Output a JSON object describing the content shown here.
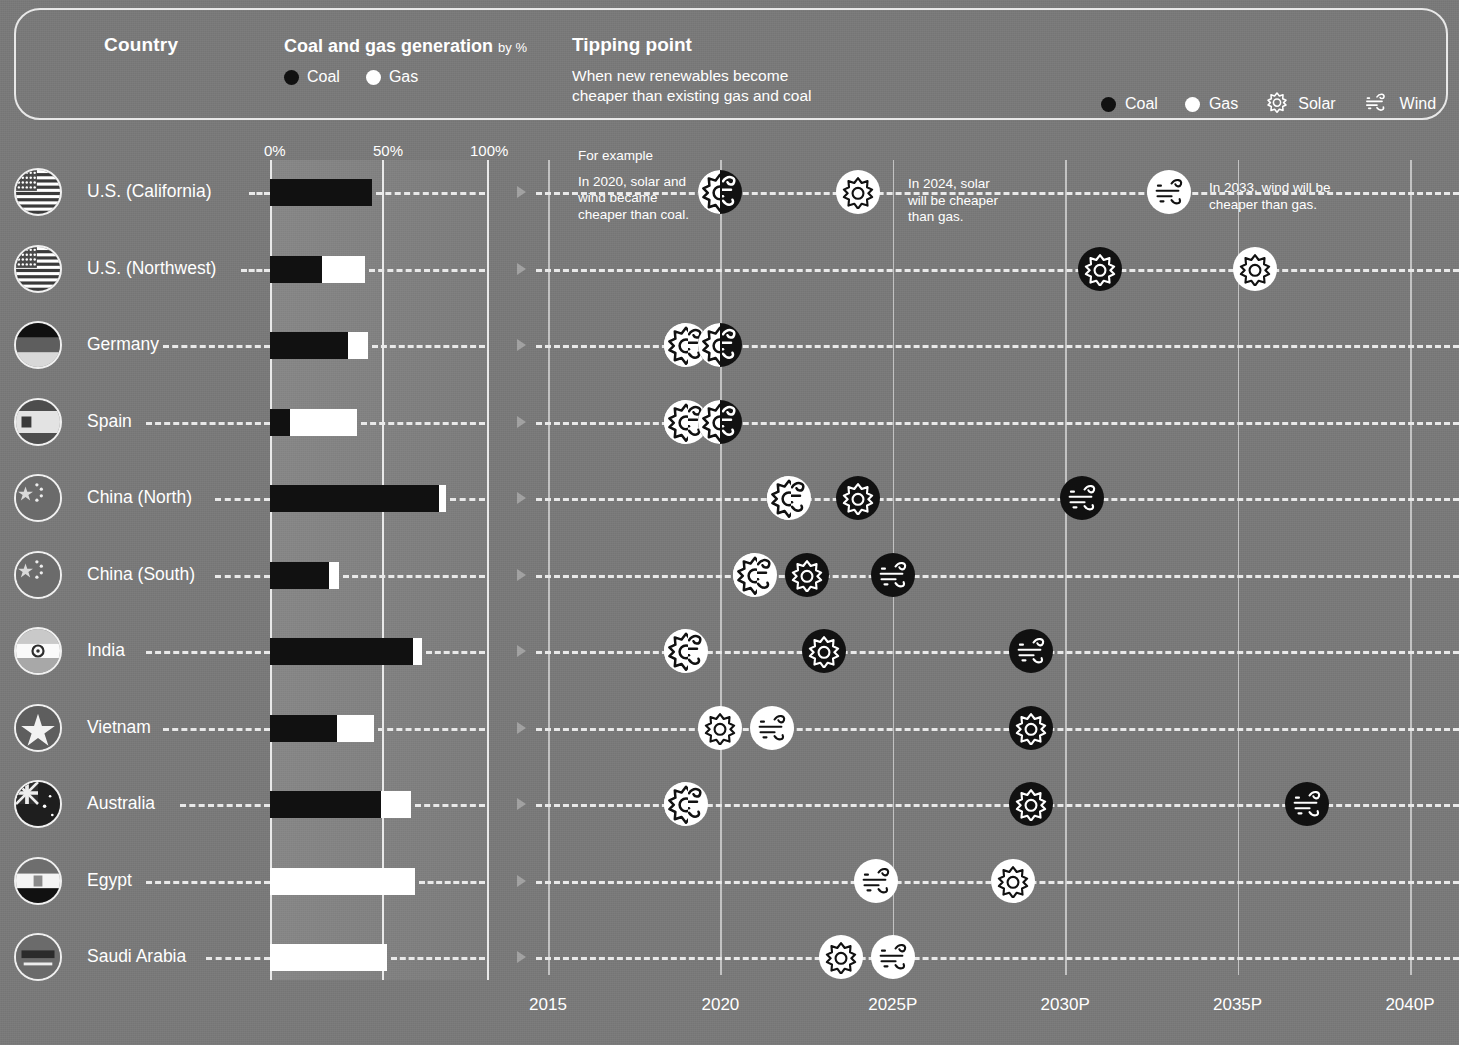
{
  "header": {
    "country_title": "Country",
    "coalgas_title": "Coal and gas generation",
    "coalgas_unit": "by %",
    "legend_coal": "Coal",
    "legend_gas": "Gas",
    "tipping_title": "Tipping point",
    "tipping_sub_line1": "When new renewables become",
    "tipping_sub_line2": "cheaper than existing gas and coal",
    "legend2_coal": "Coal",
    "legend2_gas": "Gas",
    "legend2_solar": "Solar",
    "legend2_wind": "Wind"
  },
  "bar_axis": {
    "t0": "0%",
    "t50": "50%",
    "t100": "100%"
  },
  "annotations": {
    "example_label": "For example",
    "a1_l1": "In 2020, solar and",
    "a1_l2": "wind became",
    "a1_l3": "cheaper than coal.",
    "a2_l1": "In 2024, solar",
    "a2_l2": "will be cheaper",
    "a2_l3": "than gas.",
    "a3_l1": "In 2033, wind will be",
    "a3_l2": "cheaper than gas."
  },
  "timeline_ticks": [
    "2015",
    "2020",
    "2025P",
    "2030P",
    "2035P",
    "2040P"
  ],
  "colors": {
    "background": "#797979",
    "coal": "#111111",
    "gas": "#ffffff",
    "text": "#ffffff",
    "grid": "rgba(255,255,255,0.55)"
  },
  "chart_data": {
    "type": "bar",
    "xlabel": "",
    "ylabel": "Country",
    "xlim": [
      0,
      100
    ],
    "grid": true,
    "categories": [
      "U.S. (California)",
      "U.S. (Northwest)",
      "Germany",
      "Spain",
      "China (North)",
      "China (South)",
      "India",
      "Vietnam",
      "Australia",
      "Egypt",
      "Saudi Arabia"
    ],
    "series": [
      {
        "name": "Coal",
        "values": [
          47,
          24,
          36,
          9,
          78,
          27,
          66,
          31,
          51,
          0,
          0
        ]
      },
      {
        "name": "Gas",
        "values": [
          0,
          20,
          9,
          31,
          3,
          5,
          4,
          17,
          14,
          67,
          54
        ]
      }
    ],
    "tipping_points": {
      "xaxis": {
        "ticks": [
          2015,
          2020,
          2025,
          2030,
          2035,
          2040
        ],
        "labels": [
          "2015",
          "2020",
          "2025P",
          "2030P",
          "2035P",
          "2040P"
        ],
        "range": [
          2013.6,
          2041.5
        ]
      },
      "rows": [
        {
          "country": "U.S. (California)",
          "markers": [
            {
              "year": 2020,
              "fill": "coal",
              "tech": "solar-wind"
            },
            {
              "year": 2024,
              "fill": "gas",
              "tech": "solar"
            },
            {
              "year": 2033,
              "fill": "gas",
              "tech": "wind"
            }
          ]
        },
        {
          "country": "U.S. (Northwest)",
          "markers": [
            {
              "year": 2031,
              "fill": "coal",
              "tech": "solar"
            },
            {
              "year": 2035.5,
              "fill": "gas",
              "tech": "solar"
            }
          ]
        },
        {
          "country": "Germany",
          "markers": [
            {
              "year": 2019,
              "fill": "gas",
              "tech": "solar-wind"
            },
            {
              "year": 2020,
              "fill": "coal",
              "tech": "solar-wind"
            }
          ]
        },
        {
          "country": "Spain",
          "markers": [
            {
              "year": 2019,
              "fill": "gas",
              "tech": "solar-wind"
            },
            {
              "year": 2020,
              "fill": "coal",
              "tech": "solar-wind"
            }
          ]
        },
        {
          "country": "China (North)",
          "markers": [
            {
              "year": 2022,
              "fill": "gas",
              "tech": "solar-wind"
            },
            {
              "year": 2024,
              "fill": "coal",
              "tech": "solar"
            },
            {
              "year": 2030.5,
              "fill": "coal",
              "tech": "wind"
            }
          ]
        },
        {
          "country": "China (South)",
          "markers": [
            {
              "year": 2021,
              "fill": "gas",
              "tech": "solar-wind"
            },
            {
              "year": 2022.5,
              "fill": "coal",
              "tech": "solar"
            },
            {
              "year": 2025,
              "fill": "coal",
              "tech": "wind"
            }
          ]
        },
        {
          "country": "India",
          "markers": [
            {
              "year": 2019,
              "fill": "gas",
              "tech": "solar-wind"
            },
            {
              "year": 2023,
              "fill": "coal",
              "tech": "solar"
            },
            {
              "year": 2029,
              "fill": "coal",
              "tech": "wind"
            }
          ]
        },
        {
          "country": "Vietnam",
          "markers": [
            {
              "year": 2020,
              "fill": "gas",
              "tech": "solar"
            },
            {
              "year": 2021.5,
              "fill": "gas",
              "tech": "wind"
            },
            {
              "year": 2029,
              "fill": "coal",
              "tech": "solar"
            }
          ]
        },
        {
          "country": "Australia",
          "markers": [
            {
              "year": 2019,
              "fill": "gas",
              "tech": "solar-wind"
            },
            {
              "year": 2029,
              "fill": "coal",
              "tech": "solar"
            },
            {
              "year": 2037,
              "fill": "coal",
              "tech": "wind"
            }
          ]
        },
        {
          "country": "Egypt",
          "markers": [
            {
              "year": 2024.5,
              "fill": "gas",
              "tech": "wind"
            },
            {
              "year": 2028.5,
              "fill": "gas",
              "tech": "solar"
            }
          ]
        },
        {
          "country": "Saudi Arabia",
          "markers": [
            {
              "year": 2023.5,
              "fill": "gas",
              "tech": "solar"
            },
            {
              "year": 2025,
              "fill": "gas",
              "tech": "wind"
            }
          ]
        }
      ]
    }
  }
}
